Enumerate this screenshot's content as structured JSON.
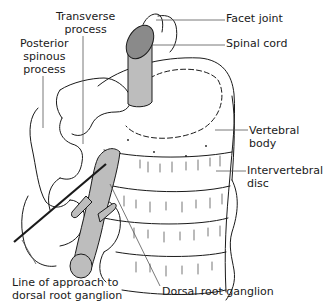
{
  "diagram": {
    "colors": {
      "ink": "#1a1a1a",
      "neural_fill": "#bdbdbd",
      "cord_top_fill": "#8a8a8a",
      "background": "#ffffff"
    },
    "labels": {
      "transverse_process": "Transverse\nprocess",
      "posterior_spinous_process": "Posterior\nspinous\nprocess",
      "facet_joint": "Facet joint",
      "spinal_cord": "Spinal cord",
      "vertebral_body": "Vertebral\nbody",
      "intervertebral_disc": "Intervertebral\ndisc",
      "line_of_approach": "Line of approach to\ndorsal root ganglion",
      "dorsal_root_ganglion": "Dorsal root ganglion"
    }
  }
}
